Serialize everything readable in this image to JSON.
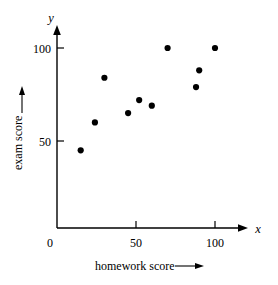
{
  "chart_data": {
    "type": "scatter",
    "title": "",
    "xlabel": "homework score",
    "ylabel": "exam score",
    "x_var": "x",
    "y_var": "y",
    "xlim": [
      0,
      110
    ],
    "ylim": [
      0,
      110
    ],
    "xticks": [
      0,
      50,
      100
    ],
    "xticklabels": [
      "0",
      "50",
      "100"
    ],
    "yticks": [
      50,
      100
    ],
    "yticklabels": [
      "50",
      "100"
    ],
    "grid": false,
    "legend": null,
    "marker": "filled-circle",
    "marker_color": "#000000",
    "points": [
      {
        "x": 15,
        "y": 45
      },
      {
        "x": 24,
        "y": 60
      },
      {
        "x": 30,
        "y": 84
      },
      {
        "x": 45,
        "y": 65
      },
      {
        "x": 52,
        "y": 72
      },
      {
        "x": 60,
        "y": 69
      },
      {
        "x": 70,
        "y": 100
      },
      {
        "x": 88,
        "y": 79
      },
      {
        "x": 90,
        "y": 88
      },
      {
        "x": 100,
        "y": 100
      }
    ]
  },
  "axes": {
    "x_axis_label": "homework score",
    "y_axis_label": "exam score",
    "x_axis_variable": "x",
    "y_axis_variable": "y",
    "origin_label": "0",
    "x_tick_50": "50",
    "x_tick_100": "100",
    "y_tick_50": "50",
    "y_tick_100": "100"
  }
}
